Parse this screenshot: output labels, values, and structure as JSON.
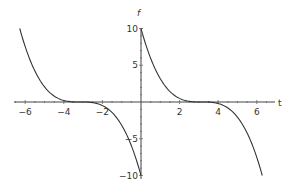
{
  "chart_data": {
    "type": "line",
    "title": "",
    "xlabel": "t",
    "ylabel": "f",
    "xlim": [
      -6.6,
      6.9
    ],
    "ylim": [
      -10,
      10
    ],
    "grid": false,
    "legend": null,
    "x_ticks": [
      -6,
      -4,
      -2,
      2,
      4,
      6
    ],
    "x_tick_labels": [
      "-6",
      "-4",
      "-2",
      "2",
      "4",
      "6"
    ],
    "y_ticks": [
      -10,
      -5,
      5,
      10
    ],
    "y_tick_labels": [
      "-10",
      "-5",
      "5",
      "10"
    ],
    "series": [
      {
        "name": "left branch",
        "formula": "f = -10*((t+pi)/pi)^3",
        "x_range": [
          -6.283,
          0
        ],
        "x": [
          -6.283,
          -5.5,
          -5,
          -4.5,
          -4,
          -3.5,
          -3.142,
          -2.5,
          -2,
          -1.5,
          -1,
          -0.5,
          0
        ],
        "y": [
          10,
          4.73,
          2.18,
          0.8,
          0.2,
          0.015,
          0,
          -0.08,
          -0.43,
          -1.43,
          -3.39,
          -6.42,
          -10
        ]
      },
      {
        "name": "right branch",
        "formula": "f = -10*((t-pi)/pi)^3",
        "x_range": [
          0,
          6.283
        ],
        "x": [
          0,
          0.5,
          1,
          1.5,
          2,
          2.5,
          3.142,
          3.5,
          4,
          4.5,
          5,
          5.5,
          6.283
        ],
        "y": [
          10,
          6.42,
          3.39,
          1.43,
          0.43,
          0.08,
          0,
          -0.015,
          -0.2,
          -0.8,
          -2.18,
          -4.73,
          -10
        ]
      }
    ]
  },
  "labels": {
    "x_axis": "t",
    "y_axis": "f",
    "x_ticks": [
      "-6",
      "-4",
      "-2",
      "2",
      "4",
      "6"
    ],
    "y_ticks": [
      "10",
      "5",
      "-5",
      "-10"
    ]
  }
}
